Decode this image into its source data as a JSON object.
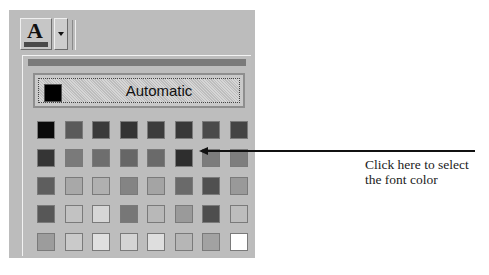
{
  "toolbar": {
    "font_color_button": {
      "glyph": "A",
      "icon": "font-color-icon",
      "bar_color": "#4a4a4a"
    },
    "dropdown_arrow": {
      "icon": "dropdown-arrow-icon"
    }
  },
  "palette": {
    "automatic": {
      "label": "Automatic",
      "swatch_color": "#000000"
    },
    "rows": [
      [
        "#0a0a0a",
        "#5a5a5a",
        "#3a3a3a",
        "#333333",
        "#3c3c3c",
        "#383838",
        "#4a4a4a",
        "#444444"
      ],
      [
        "#353535",
        "#7a7a7a",
        "#6e6e6e",
        "#666666",
        "#6a6a6a",
        "#2e2e2e",
        "#7c7c7c",
        "#7e7e7e"
      ],
      [
        "#5e5e5e",
        "#a8a8a8",
        "#b0b0b0",
        "#848484",
        "#a4a4a4",
        "#6a6a6a",
        "#505050",
        "#999999"
      ],
      [
        "#575757",
        "#c2c2c2",
        "#d6d6d6",
        "#777777",
        "#b8b8b8",
        "#9a9a9a",
        "#4e4e4e",
        "#bdbdbd"
      ],
      [
        "#9c9c9c",
        "#cacaca",
        "#e0e0e0",
        "#d4d4d4",
        "#dedede",
        "#b6b6b6",
        "#a2a2a2",
        "#ffffff"
      ]
    ]
  },
  "callout": {
    "line1": "Click here to select",
    "line2": "the font color"
  }
}
